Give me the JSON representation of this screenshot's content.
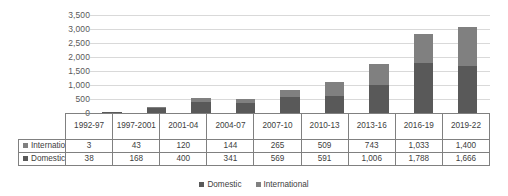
{
  "chart_data": {
    "type": "bar",
    "subtype": "stacked-column",
    "title": "",
    "xlabel": "",
    "ylabel": "",
    "ylim": [
      0,
      3500
    ],
    "yticks": [
      "0",
      "500",
      "1,000",
      "1,500",
      "2,000",
      "2,500",
      "3,000",
      "3,500"
    ],
    "ytick_values": [
      0,
      500,
      1000,
      1500,
      2000,
      2500,
      3000,
      3500
    ],
    "grid": true,
    "legend_position": "bottom",
    "categories": [
      "1992-97",
      "1997-2001",
      "2001-04",
      "2004-07",
      "2007-10",
      "2010-13",
      "2013-16",
      "2016-19",
      "2019-22"
    ],
    "category_labels_display": [
      "1992-97",
      "1997-\n2001",
      "2001-04",
      "2004-07",
      "2007-10",
      "2010-13",
      "2013-16",
      "2016-19",
      "2019-22"
    ],
    "series": [
      {
        "name": "Domestic",
        "color": "#595959",
        "values": [
          38,
          168,
          400,
          341,
          569,
          591,
          1006,
          1788,
          1666
        ],
        "labels": [
          "38",
          "168",
          "400",
          "341",
          "569",
          "591",
          "1,006",
          "1,788",
          "1,666"
        ]
      },
      {
        "name": "International",
        "color": "#808080",
        "values": [
          3,
          43,
          120,
          144,
          265,
          509,
          743,
          1033,
          1400
        ],
        "labels": [
          "3",
          "43",
          "120",
          "144",
          "265",
          "509",
          "743",
          "1,033",
          "1,400"
        ]
      }
    ],
    "stack_order_bottom_to_top": [
      "Domestic",
      "International"
    ],
    "data_table": {
      "corner_label": "",
      "column_headers": [
        "1992-97",
        "1997-2001",
        "2001-04",
        "2004-07",
        "2007-10",
        "2010-13",
        "2013-16",
        "2016-19",
        "2019-22"
      ],
      "rows": [
        {
          "label": "International",
          "swatch_color": "#808080",
          "values": [
            "3",
            "43",
            "120",
            "144",
            "265",
            "509",
            "743",
            "1,033",
            "1,400"
          ]
        },
        {
          "label": "Domestic",
          "swatch_color": "#595959",
          "values": [
            "38",
            "168",
            "400",
            "341",
            "569",
            "591",
            "1,006",
            "1,788",
            "1,666"
          ]
        }
      ]
    },
    "legend": [
      {
        "label": "Domestic",
        "color": "#595959"
      },
      {
        "label": "International",
        "color": "#808080"
      }
    ]
  }
}
